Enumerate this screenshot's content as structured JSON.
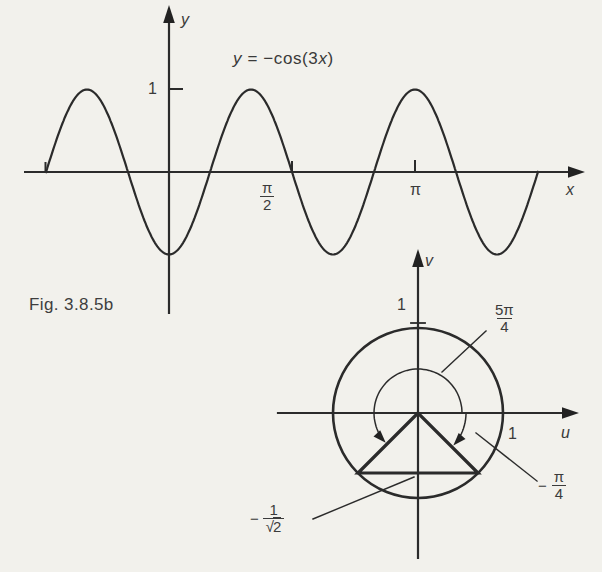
{
  "figure_caption": "Fig. 3.8.5b",
  "graph": {
    "equation": {
      "y": "y",
      "mid": " = −cos(3",
      "x": "x",
      "close": ")"
    },
    "x_axis_label": "x",
    "y_axis_label": "y",
    "y_tick_label": "1",
    "tick_pi_over_2": {
      "num": "π",
      "den": "2"
    },
    "tick_pi_label": "π"
  },
  "unit_circle": {
    "u_axis_label": "u",
    "v_axis_label": "v",
    "u_tick_label": "1",
    "v_tick_label": "1",
    "angle_ccw": {
      "num": "5π",
      "den": "4"
    },
    "angle_cw": {
      "sign": "−",
      "num": "π",
      "den": "4"
    },
    "ordinate": {
      "sign": "−",
      "num": "1",
      "radical": "√",
      "radicand": "2"
    }
  },
  "chart_data": [
    {
      "type": "line",
      "title": "y = −cos(3x)",
      "xlabel": "x",
      "ylabel": "y",
      "amplitude": 1,
      "frequency": 3,
      "negated_cosine": true,
      "x_range": [
        -1.5707963,
        4.712389
      ],
      "ylim": [
        -1,
        1
      ],
      "x_ticks": [
        {
          "x": 1.5707963,
          "label": "π/2"
        },
        {
          "x": 3.1415927,
          "label": "π"
        }
      ],
      "y_ticks": [
        {
          "y": 1,
          "label": "1"
        }
      ],
      "maxima_x": [
        -1.0471976,
        1.0471976,
        3.1415927
      ],
      "minima_x": [
        0,
        2.0943951,
        4.1887902
      ],
      "grid": false,
      "legend": "none"
    },
    {
      "type": "diagram",
      "subtype": "unit-circle",
      "xlabel": "u",
      "ylabel": "v",
      "radius": 1,
      "axis_marks": [
        {
          "axis": "u",
          "value": 1,
          "label": "1"
        },
        {
          "axis": "v",
          "value": 1,
          "label": "1"
        }
      ],
      "angles": [
        {
          "label": "5π/4",
          "value_rad": 3.9269908,
          "direction": "counterclockwise"
        },
        {
          "label": "−π/4",
          "value_rad": -0.7853982,
          "direction": "clockwise"
        }
      ],
      "marked_value": {
        "label": "−1/√2",
        "value": -0.7071068
      },
      "triangle_vertices": [
        [
          0,
          0
        ],
        [
          -0.7071068,
          -0.7071068
        ],
        [
          0.7071068,
          -0.7071068
        ]
      ]
    }
  ]
}
